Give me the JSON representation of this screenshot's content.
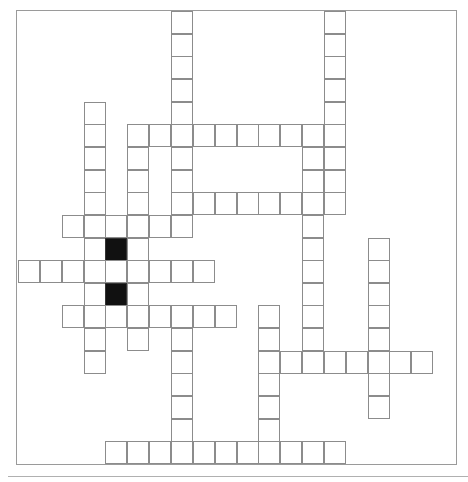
{
  "puzzle": {
    "type": "crossword",
    "cell_size": 21.85,
    "origin": {
      "x": 19,
      "y": 12
    },
    "row_height": 22.65,
    "cols": 19,
    "rows": 20,
    "colors": {
      "border": "#8c8c8c",
      "black_cell": "#111111",
      "background": "#ffffff"
    },
    "words": [
      {
        "dir": "down",
        "col": 7,
        "row": 0,
        "len": 10
      },
      {
        "dir": "down",
        "col": 14,
        "row": 0,
        "len": 9
      },
      {
        "dir": "across",
        "col": 5,
        "row": 5,
        "len": 10
      },
      {
        "dir": "down",
        "col": 3,
        "row": 4,
        "len": 12
      },
      {
        "dir": "down",
        "col": 5,
        "row": 5,
        "len": 10
      },
      {
        "dir": "across",
        "col": 7,
        "row": 8,
        "len": 8
      },
      {
        "dir": "down",
        "col": 13,
        "row": 5,
        "len": 11
      },
      {
        "dir": "across",
        "col": 2,
        "row": 9,
        "len": 6
      },
      {
        "dir": "down",
        "col": 4,
        "row": 9,
        "len": 5
      },
      {
        "dir": "across",
        "col": 0,
        "row": 11,
        "len": 9
      },
      {
        "dir": "across",
        "col": 2,
        "row": 13,
        "len": 8
      },
      {
        "dir": "down",
        "col": 7,
        "row": 13,
        "len": 7
      },
      {
        "dir": "down",
        "col": 11,
        "row": 13,
        "len": 7
      },
      {
        "dir": "across",
        "col": 11,
        "row": 15,
        "len": 8
      },
      {
        "dir": "down",
        "col": 16,
        "row": 10,
        "len": 8
      },
      {
        "dir": "across",
        "col": 4,
        "row": 19,
        "len": 11
      }
    ],
    "black_cells": [
      {
        "col": 4,
        "row": 10
      },
      {
        "col": 4,
        "row": 12
      }
    ]
  }
}
